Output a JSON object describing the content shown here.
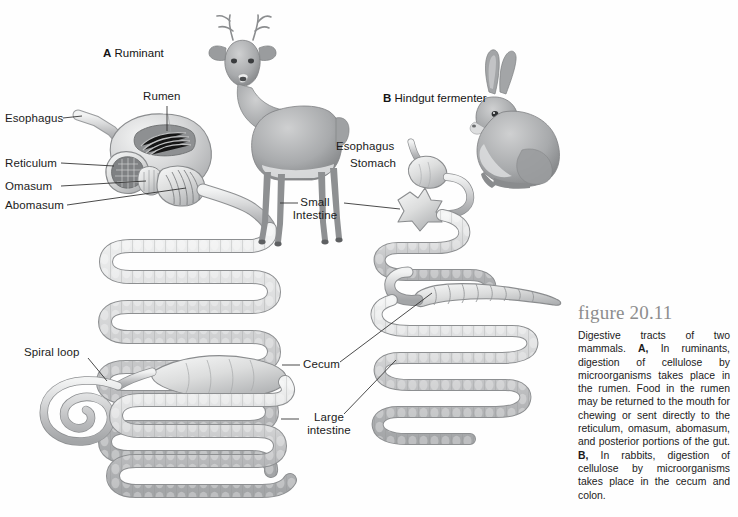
{
  "figure": {
    "number_label": "figure 20.11",
    "caption_part1": "Digestive tracts of two mammals. ",
    "caption_a_marker": "A,",
    "caption_part2": " In ruminants, digestion of cellulose by microorganisms takes place in the rumen. Food in the rumen may be returned to the mouth for chewing or sent directly to the reticulum, omasum, abomasum, and posterior portions of the gut. ",
    "caption_b_marker": "B,",
    "caption_part3": " In rabbits, digestion of cellulose by microorganisms takes place in the cecum and colon."
  },
  "panels": {
    "a": {
      "marker": "A",
      "title": "Ruminant"
    },
    "b": {
      "marker": "B",
      "title": "Hindgut fermenter"
    }
  },
  "labels": {
    "ruminant": {
      "esophagus": "Esophagus",
      "rumen": "Rumen",
      "reticulum": "Reticulum",
      "omasum": "Omasum",
      "abomasum": "Abomasum",
      "small_intestine": "Small Intestine",
      "spiral_loop": "Spiral loop",
      "cecum": "Cecum",
      "large_intestine": "Large intestine"
    },
    "hindgut": {
      "esophagus": "Esophagus",
      "stomach": "Stomach"
    }
  },
  "illustrations": {
    "deer": "deer-illustration",
    "rabbit": "rabbit-illustration"
  },
  "colors": {
    "organ_fill": "#c9cacb",
    "organ_fill_light": "#e2e3e4",
    "organ_stroke": "#8e9092",
    "leader_line": "#2b2b2b",
    "figure_number": "#8d8d8d",
    "text": "#1a1a1a"
  }
}
